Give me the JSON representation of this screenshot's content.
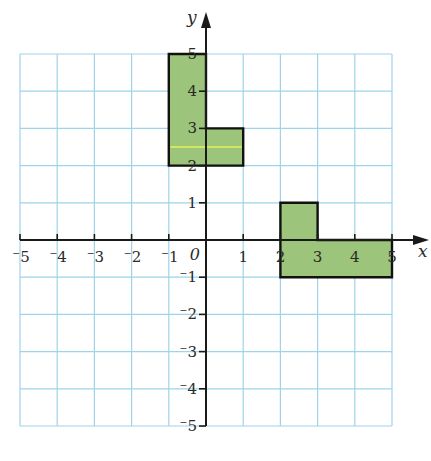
{
  "diagram": {
    "type": "coordinate-grid",
    "x_axis": {
      "label": "x",
      "min": -5,
      "max": 5,
      "ticks": [
        -5,
        -4,
        -3,
        -2,
        -1,
        1,
        2,
        3,
        4,
        5
      ]
    },
    "y_axis": {
      "label": "y",
      "min": -5,
      "max": 5,
      "ticks": [
        -5,
        -4,
        -3,
        -2,
        -1,
        1,
        2,
        3,
        4,
        5
      ]
    },
    "origin_label": "0",
    "colors": {
      "grid": "#9fd3ea",
      "axis": "#1a1a1a",
      "shape_fill": "#9cc47a",
      "shape_stroke": "#111111",
      "highlight_line": "#e6f35a"
    },
    "shapes": [
      {
        "name": "L-shape-A",
        "vertices": [
          [
            -1,
            5
          ],
          [
            0,
            5
          ],
          [
            0,
            3
          ],
          [
            1,
            3
          ],
          [
            1,
            2
          ],
          [
            -1,
            2
          ]
        ]
      },
      {
        "name": "L-shape-B",
        "vertices": [
          [
            2,
            1
          ],
          [
            3,
            1
          ],
          [
            3,
            0
          ],
          [
            5,
            0
          ],
          [
            5,
            -1
          ],
          [
            2,
            -1
          ]
        ]
      }
    ],
    "highlight_line": {
      "y": 2.5,
      "x_from": -1,
      "x_to": 1
    }
  },
  "chart_data": {
    "type": "scatter",
    "title": "",
    "xlabel": "x",
    "ylabel": "y",
    "xlim": [
      -5,
      5
    ],
    "ylim": [
      -5,
      5
    ],
    "grid": true,
    "series": [
      {
        "name": "Shape A",
        "x": [
          -1,
          0,
          0,
          1,
          1,
          -1,
          -1
        ],
        "y": [
          5,
          5,
          3,
          3,
          2,
          2,
          5
        ]
      },
      {
        "name": "Shape B",
        "x": [
          2,
          3,
          3,
          5,
          5,
          2,
          2
        ],
        "y": [
          1,
          1,
          0,
          0,
          -1,
          -1,
          1
        ]
      }
    ]
  }
}
